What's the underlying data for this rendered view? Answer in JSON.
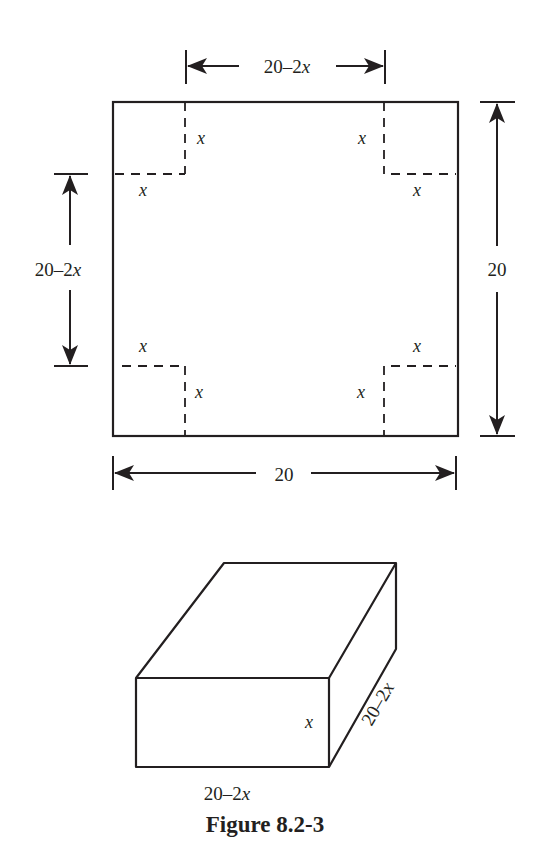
{
  "figure": {
    "caption": "Figure 8.2-3",
    "square_sheet": {
      "top_dimension": {
        "num": "20–2",
        "var": "x"
      },
      "left_dimension": {
        "num": "20–2",
        "var": "x"
      },
      "right_dimension": "20",
      "bottom_dimension": "20",
      "corner_labels": {
        "top_left_vertical": "x",
        "top_left_horizontal": "x",
        "top_right_vertical": "x",
        "top_right_horizontal": "x",
        "bottom_left_horizontal": "x",
        "bottom_left_vertical": "x",
        "bottom_right_horizontal": "x",
        "bottom_right_vertical": "x"
      }
    },
    "box": {
      "height_label": "x",
      "length_label": {
        "num": "20–2",
        "var": "x"
      },
      "depth_label": {
        "num": "20–2",
        "var": "x"
      }
    },
    "colors": {
      "stroke": "#231f20",
      "background": "#ffffff"
    }
  }
}
